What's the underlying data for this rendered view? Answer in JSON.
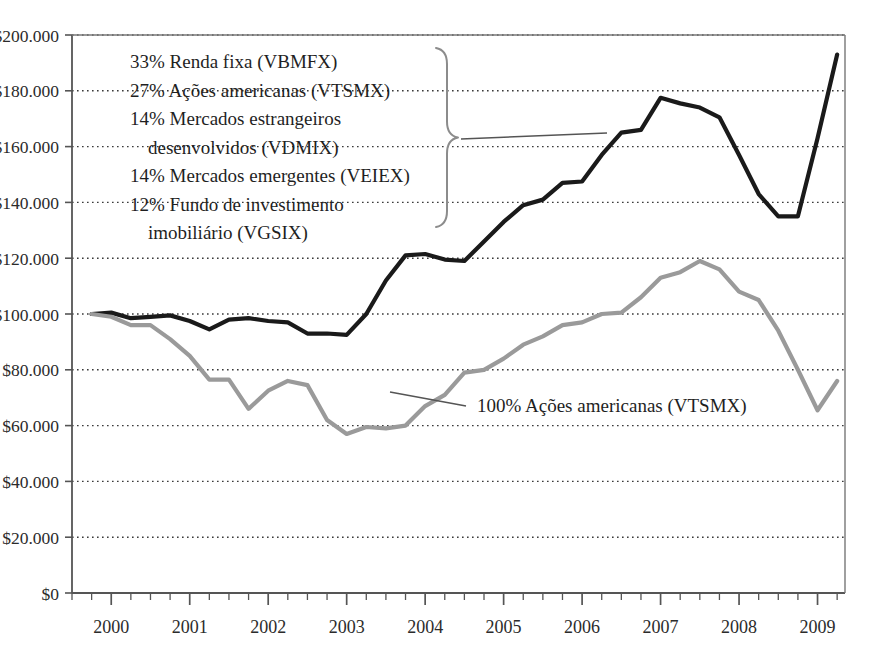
{
  "chart_data": {
    "type": "line",
    "title": "",
    "xlabel": "",
    "ylabel": "",
    "xlim": [
      1999.5,
      2009.35
    ],
    "ylim": [
      0,
      200000
    ],
    "grid": true,
    "grid_style": "dotted-horizontal",
    "legend_position": "inside-upper-left",
    "currency_prefix": "$",
    "y_ticks": [
      0,
      20000,
      40000,
      60000,
      80000,
      100000,
      120000,
      140000,
      160000,
      180000,
      200000
    ],
    "y_tick_labels": [
      "$0",
      "$20.000",
      "$40.000",
      "$60.000",
      "$80.000",
      "$100.000",
      "$120.000",
      "$140.000",
      "$160.000",
      "$180.000",
      "$200.000"
    ],
    "x_ticks": [
      2000,
      2001,
      2002,
      2003,
      2004,
      2005,
      2006,
      2007,
      2008,
      2009
    ],
    "x_tick_labels": [
      "2000",
      "2001",
      "2002",
      "2003",
      "2004",
      "2005",
      "2006",
      "2007",
      "2008",
      "2009"
    ],
    "x_minor_ticks_per_year": 4,
    "series": [
      {
        "name": "Carteira diversificada",
        "color": "#1a1a1a",
        "width": 4.2,
        "x": [
          1999.75,
          2000.0,
          2000.25,
          2000.5,
          2000.75,
          2001.0,
          2001.25,
          2001.5,
          2001.75,
          2002.0,
          2002.25,
          2002.5,
          2002.75,
          2003.0,
          2003.25,
          2003.5,
          2003.75,
          2004.0,
          2004.25,
          2004.5,
          2004.75,
          2005.0,
          2005.25,
          2005.5,
          2005.75,
          2006.0,
          2006.25,
          2006.5,
          2006.75,
          2007.0,
          2007.25,
          2007.5,
          2007.75,
          2008.0,
          2008.25,
          2008.5,
          2008.75,
          2009.0,
          2009.25
        ],
        "values": [
          100000,
          100500,
          98500,
          99000,
          99500,
          97500,
          94500,
          98000,
          98500,
          97500,
          97000,
          93000,
          93000,
          92500,
          100000,
          112000,
          121000,
          121500,
          119500,
          119000,
          126000,
          133000,
          139000,
          141000,
          147000,
          147500,
          157000,
          165000,
          166000,
          177500,
          175500,
          174000,
          170500,
          157000,
          143000,
          135000,
          135000,
          163000,
          193000
        ]
      },
      {
        "name": "100% Ações americanas (VTSMX)",
        "color": "#9a9a9a",
        "width": 4.2,
        "x": [
          1999.75,
          2000.0,
          2000.25,
          2000.5,
          2000.75,
          2001.0,
          2001.25,
          2001.5,
          2001.75,
          2002.0,
          2002.25,
          2002.5,
          2002.75,
          2003.0,
          2003.25,
          2003.5,
          2003.75,
          2004.0,
          2004.25,
          2004.5,
          2004.75,
          2005.0,
          2005.25,
          2005.5,
          2005.75,
          2006.0,
          2006.25,
          2006.5,
          2006.75,
          2007.0,
          2007.25,
          2007.5,
          2007.75,
          2008.0,
          2008.25,
          2008.5,
          2008.75,
          2009.0,
          2009.25
        ],
        "values": [
          100000,
          99000,
          96000,
          96000,
          91000,
          85000,
          76500,
          76500,
          66000,
          72500,
          76000,
          74500,
          62000,
          57000,
          59500,
          59000,
          60000,
          67000,
          71000,
          79000,
          80000,
          84000,
          89000,
          92000,
          96000,
          97000,
          100000,
          100500,
          106000,
          113000,
          115000,
          119000,
          116000,
          108000,
          105000,
          94000,
          80000,
          65500,
          76000
        ]
      }
    ],
    "annotations": [
      {
        "name": "portfolio-legend",
        "lines": [
          "33% Renda fixa (VBMFX)",
          "27% Ações americanas (VTSMX)",
          "14% Mercados estrangeiros",
          "desenvolvidos (VDMIX)",
          "14% Mercados emergentes (VEIEX)",
          "12% Fundo de investimento",
          "imobiliário (VGSIX)"
        ],
        "indents": [
          0,
          0,
          0,
          1,
          0,
          0,
          1
        ],
        "brace": true
      },
      {
        "name": "us-stocks-callout",
        "text": "100% Ações americanas (VTSMX)"
      }
    ]
  }
}
